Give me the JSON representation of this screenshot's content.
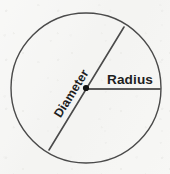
{
  "figure": {
    "kind": "geometry-diagram",
    "background_color": "#f6f6f4",
    "stroke_color": "#4a4a4a",
    "text_color": "#1e1e1e",
    "circle": {
      "center_x": 86,
      "center_y": 88,
      "radius": 75,
      "stroke_width": 1.4
    },
    "radius_line": {
      "label": "Radius",
      "from_x": 86,
      "from_y": 89,
      "to_x": 161,
      "to_y": 89,
      "stroke_width": 2.2,
      "label_x": 130,
      "label_y": 80,
      "label_rotation_deg": 0
    },
    "diameter_line": {
      "label": "Diameter",
      "from_x": 49,
      "from_y": 150,
      "to_x": 124,
      "to_y": 27,
      "stroke_width": 1.6,
      "label_x": 72,
      "label_y": 94,
      "label_rotation_deg": -58
    },
    "center_point": {
      "x": 86,
      "y": 88,
      "dot_radius": 3.1,
      "fill": "#111111"
    }
  },
  "labels": {
    "radius": "Radius",
    "diameter": "Diameter"
  }
}
